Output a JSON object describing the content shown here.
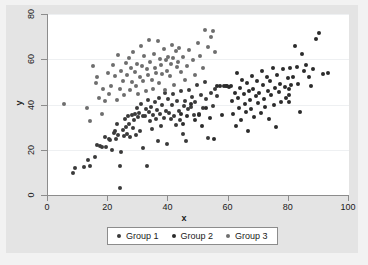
{
  "chart_data": {
    "type": "scatter",
    "title": "",
    "xlabel": "x",
    "ylabel": "y",
    "xlim": [
      0,
      100
    ],
    "ylim": [
      0,
      80
    ],
    "xticks": [
      0,
      20,
      40,
      60,
      80,
      100
    ],
    "yticks": [
      0,
      20,
      40,
      60,
      80
    ],
    "grid": "horizontal",
    "legend_position": "bottom-center",
    "series": [
      {
        "name": "Group 1",
        "color": "#3a3a3a",
        "points": [
          [
            8.2,
            9.6
          ],
          [
            9.0,
            11.8
          ],
          [
            11.8,
            12.3
          ],
          [
            13.2,
            15.4
          ],
          [
            13.8,
            12.6
          ],
          [
            15.6,
            17.0
          ],
          [
            16.2,
            22.1
          ],
          [
            17.4,
            21.5
          ],
          [
            18.0,
            21.1
          ],
          [
            18.8,
            25.7
          ],
          [
            19.4,
            21.3
          ],
          [
            20.1,
            24.8
          ],
          [
            20.7,
            24.2
          ],
          [
            21.2,
            20.0
          ],
          [
            21.8,
            27.2
          ],
          [
            22.2,
            28.4
          ],
          [
            22.7,
            24.6
          ],
          [
            23.0,
            31.5
          ],
          [
            23.4,
            26.3
          ],
          [
            23.8,
            3.1
          ],
          [
            24.0,
            12.6
          ],
          [
            24.4,
            18.8
          ],
          [
            24.8,
            28.7
          ],
          [
            25.1,
            26.0
          ],
          [
            25.5,
            33.4
          ],
          [
            25.9,
            30.2
          ],
          [
            26.2,
            27.0
          ],
          [
            26.7,
            35.0
          ],
          [
            27.0,
            31.2
          ],
          [
            27.3,
            25.7
          ],
          [
            27.8,
            35.5
          ],
          [
            28.1,
            29.4
          ],
          [
            28.5,
            33.0
          ],
          [
            28.9,
            35.8
          ],
          [
            29.2,
            26.5
          ],
          [
            29.6,
            38.5
          ],
          [
            29.9,
            34.3
          ],
          [
            30.3,
            36.2
          ],
          [
            30.6,
            28.1
          ],
          [
            31.0,
            40.3
          ],
          [
            31.4,
            35.1
          ],
          [
            31.7,
            20.9
          ],
          [
            32.1,
            34.7
          ],
          [
            32.5,
            38.0
          ],
          [
            32.8,
            13.0
          ],
          [
            33.2,
            42.0
          ],
          [
            33.5,
            36.6
          ],
          [
            33.9,
            32.7
          ],
          [
            34.3,
            39.1
          ],
          [
            34.6,
            29.3
          ],
          [
            35.0,
            35.3
          ],
          [
            35.4,
            41.2
          ],
          [
            35.8,
            33.8
          ],
          [
            36.1,
            37.4
          ],
          [
            36.5,
            24.0
          ],
          [
            36.9,
            43.0
          ],
          [
            37.2,
            35.6
          ],
          [
            37.6,
            30.5
          ],
          [
            38.0,
            40.0
          ],
          [
            38.4,
            34.2
          ],
          [
            38.8,
            45.2
          ],
          [
            39.1,
            37.0
          ],
          [
            39.5,
            22.4
          ],
          [
            39.9,
            42.5
          ],
          [
            40.3,
            36.3
          ],
          [
            40.8,
            33.4
          ],
          [
            41.2,
            39.7
          ],
          [
            41.6,
            44.5
          ],
          [
            42.0,
            35.0
          ],
          [
            42.5,
            30.8
          ],
          [
            43.0,
            41.6
          ],
          [
            43.4,
            37.2
          ],
          [
            43.9,
            33.0
          ],
          [
            44.3,
            45.9
          ],
          [
            44.8,
            27.0
          ],
          [
            45.2,
            39.3
          ],
          [
            45.6,
            41.4
          ],
          [
            46.0,
            23.8
          ],
          [
            46.4,
            37.8
          ],
          [
            47.0,
            46.5
          ],
          [
            47.5,
            39.0
          ],
          [
            48.0,
            43.2
          ],
          [
            48.5,
            35.4
          ],
          [
            49.0,
            41.0
          ],
          [
            49.6,
            48.4
          ],
          [
            50.2,
            36.0
          ],
          [
            50.8,
            44.1
          ],
          [
            51.5,
            38.6
          ],
          [
            52.0,
            50.0
          ],
          [
            52.6,
            42.3
          ],
          [
            53.2,
            25.2
          ],
          [
            54.0,
            45.0
          ],
          [
            54.8,
            39.5
          ],
          [
            55.5,
            47.0
          ],
          [
            56.2,
            43.7
          ]
        ]
      },
      {
        "name": "Group 2",
        "color": "#2b2b2b",
        "points": [
          [
            44.2,
            36.0
          ],
          [
            45.0,
            31.5
          ],
          [
            46.2,
            34.8
          ],
          [
            47.5,
            40.1
          ],
          [
            48.8,
            33.0
          ],
          [
            50.0,
            35.2
          ],
          [
            51.2,
            30.4
          ],
          [
            52.5,
            38.6
          ],
          [
            53.8,
            33.9
          ],
          [
            55.0,
            24.8
          ],
          [
            56.2,
            48.0
          ],
          [
            57.0,
            48.2
          ],
          [
            57.8,
            35.5
          ],
          [
            58.4,
            48.1
          ],
          [
            59.0,
            48.3
          ],
          [
            59.6,
            48.0
          ],
          [
            60.2,
            47.9
          ],
          [
            60.8,
            48.2
          ],
          [
            61.2,
            41.5
          ],
          [
            61.6,
            36.0
          ],
          [
            62.0,
            45.2
          ],
          [
            62.4,
            30.3
          ],
          [
            62.8,
            54.0
          ],
          [
            63.1,
            43.0
          ],
          [
            63.5,
            38.5
          ],
          [
            63.9,
            47.2
          ],
          [
            64.2,
            33.1
          ],
          [
            64.6,
            51.0
          ],
          [
            65.0,
            44.5
          ],
          [
            65.3,
            40.2
          ],
          [
            65.7,
            36.8
          ],
          [
            66.0,
            49.5
          ],
          [
            66.4,
            28.1
          ],
          [
            66.8,
            45.8
          ],
          [
            67.1,
            42.0
          ],
          [
            67.5,
            38.0
          ],
          [
            67.9,
            52.5
          ],
          [
            68.2,
            47.0
          ],
          [
            68.6,
            34.5
          ],
          [
            69.0,
            43.6
          ],
          [
            69.4,
            50.2
          ],
          [
            69.8,
            40.7
          ],
          [
            70.2,
            45.0
          ],
          [
            70.6,
            36.2
          ],
          [
            71.0,
            55.0
          ],
          [
            71.4,
            48.8
          ],
          [
            71.8,
            42.5
          ],
          [
            72.2,
            38.9
          ],
          [
            72.6,
            52.0
          ],
          [
            73.0,
            46.0
          ],
          [
            73.4,
            33.6
          ],
          [
            73.8,
            50.5
          ],
          [
            74.2,
            44.2
          ],
          [
            74.6,
            56.0
          ],
          [
            75.0,
            40.0
          ],
          [
            75.4,
            47.5
          ],
          [
            75.8,
            30.2
          ],
          [
            76.2,
            53.0
          ],
          [
            76.6,
            45.5
          ],
          [
            77.0,
            49.0
          ],
          [
            77.4,
            41.0
          ],
          [
            78.0,
            55.5
          ],
          [
            78.6,
            47.8
          ],
          [
            79.2,
            43.0
          ],
          [
            79.8,
            51.5
          ],
          [
            80.0,
            47.0
          ],
          [
            80.0,
            44.0
          ],
          [
            80.0,
            41.2
          ],
          [
            80.4,
            56.0
          ],
          [
            80.8,
            48.5
          ],
          [
            81.4,
            52.2
          ],
          [
            82.0,
            66.0
          ],
          [
            82.6,
            56.5
          ],
          [
            83.2,
            49.0
          ],
          [
            83.8,
            36.8
          ],
          [
            84.4,
            62.5
          ],
          [
            85.0,
            55.0
          ],
          [
            85.8,
            57.5
          ],
          [
            86.6,
            52.0
          ],
          [
            87.4,
            48.2
          ],
          [
            88.2,
            55.8
          ],
          [
            89.0,
            69.0
          ],
          [
            90.0,
            71.5
          ],
          [
            91.5,
            53.5
          ],
          [
            93.0,
            54.0
          ]
        ]
      },
      {
        "name": "Group 3",
        "color": "#6e6e6e",
        "points": [
          [
            5.2,
            40.2
          ],
          [
            12.8,
            38.5
          ],
          [
            14.0,
            32.5
          ],
          [
            15.0,
            57.0
          ],
          [
            15.8,
            49.5
          ],
          [
            16.4,
            52.0
          ],
          [
            17.0,
            43.0
          ],
          [
            17.8,
            36.0
          ],
          [
            18.4,
            46.8
          ],
          [
            19.0,
            41.5
          ],
          [
            19.8,
            54.0
          ],
          [
            20.4,
            44.6
          ],
          [
            21.0,
            48.0
          ],
          [
            21.6,
            57.5
          ],
          [
            22.2,
            52.5
          ],
          [
            22.8,
            42.0
          ],
          [
            23.2,
            62.0
          ],
          [
            23.8,
            47.0
          ],
          [
            24.2,
            55.0
          ],
          [
            24.8,
            50.2
          ],
          [
            25.2,
            44.0
          ],
          [
            25.8,
            58.5
          ],
          [
            26.2,
            53.0
          ],
          [
            26.8,
            60.5
          ],
          [
            27.2,
            46.5
          ],
          [
            27.6,
            56.0
          ],
          [
            28.0,
            50.0
          ],
          [
            28.4,
            63.0
          ],
          [
            28.8,
            54.5
          ],
          [
            29.2,
            48.0
          ],
          [
            29.6,
            58.0
          ],
          [
            30.0,
            44.5
          ],
          [
            30.4,
            52.0
          ],
          [
            30.8,
            66.0
          ],
          [
            31.2,
            57.0
          ],
          [
            31.6,
            50.5
          ],
          [
            32.0,
            61.5
          ],
          [
            32.4,
            46.0
          ],
          [
            32.8,
            55.5
          ],
          [
            33.2,
            53.0
          ],
          [
            33.6,
            68.5
          ],
          [
            34.0,
            59.0
          ],
          [
            34.4,
            51.0
          ],
          [
            34.8,
            47.0
          ],
          [
            35.2,
            62.5
          ],
          [
            35.6,
            56.0
          ],
          [
            36.0,
            54.0
          ],
          [
            36.4,
            68.0
          ],
          [
            36.8,
            49.5
          ],
          [
            37.2,
            60.0
          ],
          [
            37.6,
            57.5
          ],
          [
            38.0,
            53.5
          ],
          [
            38.4,
            64.5
          ],
          [
            38.8,
            46.5
          ],
          [
            39.2,
            59.5
          ],
          [
            39.6,
            55.0
          ],
          [
            40.0,
            61.0
          ],
          [
            40.4,
            52.5
          ],
          [
            40.8,
            58.0
          ],
          [
            41.2,
            66.5
          ],
          [
            41.6,
            60.5
          ],
          [
            42.0,
            48.5
          ],
          [
            42.4,
            63.5
          ],
          [
            42.8,
            56.5
          ],
          [
            43.2,
            59.0
          ],
          [
            43.6,
            65.0
          ],
          [
            44.2,
            54.5
          ],
          [
            44.8,
            61.0
          ],
          [
            45.5,
            51.0
          ],
          [
            46.2,
            57.0
          ],
          [
            47.0,
            64.0
          ],
          [
            48.2,
            59.5
          ],
          [
            49.0,
            53.0
          ],
          [
            49.8,
            67.0
          ],
          [
            50.6,
            61.5
          ],
          [
            51.4,
            56.0
          ],
          [
            52.2,
            73.0
          ],
          [
            53.0,
            65.5
          ],
          [
            54.0,
            70.0
          ],
          [
            54.8,
            72.5
          ],
          [
            55.6,
            63.0
          ]
        ]
      }
    ]
  },
  "legend": {
    "items": [
      {
        "label": "Group 1",
        "color": "#3a3a3a"
      },
      {
        "label": "Group 2",
        "color": "#2b2b2b"
      },
      {
        "label": "Group 3",
        "color": "#6e6e6e"
      }
    ]
  },
  "colors": {
    "page_background": "#e9e9e9",
    "graph_background": "#e4e4e4",
    "plot_background": "#ffffff",
    "axis": "#8c8c8c",
    "gridline": "#eef0f2",
    "text": "#1a1a1a"
  }
}
